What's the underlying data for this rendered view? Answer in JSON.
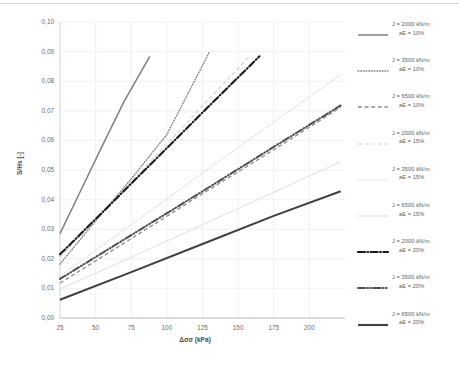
{
  "chart_data": {
    "type": "line",
    "title": "",
    "xlabel": "Δσσ (kPa)",
    "ylabel": "S/Hs [-]",
    "xlim": [
      25,
      225
    ],
    "ylim": [
      0.0,
      0.1
    ],
    "xticks": [
      25,
      50,
      75,
      100,
      125,
      150,
      175,
      200
    ],
    "xtick_labels": [
      "25",
      "50",
      "75",
      "100",
      "125",
      "150",
      "175",
      "200"
    ],
    "yticks": [
      0.0,
      0.01,
      0.02,
      0.03,
      0.04,
      0.05,
      0.06,
      0.07,
      0.08,
      0.09,
      0.1
    ],
    "ytick_labels": [
      "0,00",
      "0,01",
      "0,02",
      "0,03",
      "0,04",
      "0,05",
      "0,06",
      "0,07",
      "0,08",
      "0,09",
      "0,10"
    ],
    "grid": true,
    "legend_position": "right",
    "decimal_separator": ",",
    "series": [
      {
        "name": "J = 2000 kN/m aE = 10%",
        "label_line1": "J = 2000 kN/m",
        "label_line2": "aE = 10%",
        "J": 2000,
        "aE": "10%",
        "style": "solid",
        "color": "#808080",
        "width": 1.5,
        "x": [
          25,
          40,
          55,
          70,
          88
        ],
        "y": [
          0.0285,
          0.0435,
          0.0585,
          0.0732,
          0.0884
        ]
      },
      {
        "name": "J = 3500 kN/m aE = 10%",
        "label_line1": "J = 3500 kN/m",
        "label_line2": "aE = 10%",
        "J": 3500,
        "aE": "10%",
        "style": "dotted",
        "color": "#7f7f7f",
        "width": 1.4,
        "x": [
          25,
          50,
          75,
          100,
          130
        ],
        "y": [
          0.0182,
          0.0328,
          0.047,
          0.062,
          0.09
        ]
      },
      {
        "name": "J = 6500 kN/m aE = 10%",
        "label_line1": "J = 6500 kN/m",
        "label_line2": "aE = 10%",
        "J": 6500,
        "aE": "10%",
        "style": "dashed",
        "color": "#8c8c8c",
        "width": 1.3,
        "x": [
          25,
          75,
          125,
          175,
          222
        ],
        "y": [
          0.0118,
          0.0268,
          0.042,
          0.0568,
          0.0712
        ]
      },
      {
        "name": "J = 2000 kN/m aE = 15%",
        "label_line1": "J = 2000 kN/m",
        "label_line2": "aE = 15%",
        "J": 2000,
        "aE": "15%",
        "style": "dashed-light",
        "color": "#d2d2d2",
        "width": 1.2,
        "x": [
          25,
          60,
          95,
          130,
          158
        ],
        "y": [
          0.0205,
          0.0385,
          0.0562,
          0.0742,
          0.0884
        ]
      },
      {
        "name": "J = 3500 kN/m aE = 15%",
        "label_line1": "J = 3500 kN/m",
        "label_line2": "aE = 15%",
        "J": 3500,
        "aE": "15%",
        "style": "dotted-light",
        "color": "#dcdcdc",
        "width": 1.2,
        "x": [
          25,
          75,
          125,
          175,
          222
        ],
        "y": [
          0.0142,
          0.0315,
          0.049,
          0.0662,
          0.0822
        ]
      },
      {
        "name": "J = 6500 kN/m aE = 15%",
        "label_line1": "J = 6500 kN/m",
        "label_line2": "aE = 15%",
        "J": 6500,
        "aE": "15%",
        "style": "solid-light",
        "color": "#e2e2e2",
        "width": 1.2,
        "x": [
          25,
          75,
          125,
          175,
          222
        ],
        "y": [
          0.0098,
          0.0205,
          0.0315,
          0.0425,
          0.0528
        ]
      },
      {
        "name": "J = 2000 kN/m aE = 20%",
        "label_line1": "J = 2000 kN/m",
        "label_line2": "aE = 20%",
        "J": 2000,
        "aE": "20%",
        "style": "dashdot-thick",
        "color": "#1a1a1a",
        "width": 2.1,
        "x": [
          25,
          60,
          95,
          130,
          165
        ],
        "y": [
          0.0215,
          0.0382,
          0.055,
          0.0718,
          0.0884
        ]
      },
      {
        "name": "J = 3500 kN/m aE = 20%",
        "label_line1": "J = 3500 kN/m",
        "label_line2": "aE = 20%",
        "J": 3500,
        "aE": "20%",
        "style": "dashdotdot-thick",
        "color": "#4d4d4d",
        "width": 2.0,
        "x": [
          25,
          75,
          125,
          175,
          222
        ],
        "y": [
          0.0132,
          0.028,
          0.0428,
          0.0578,
          0.0718
        ]
      },
      {
        "name": "J = 6500 kN/m aE = 20%",
        "label_line1": "J = 6500 kN/m",
        "label_line2": "aE = 20%",
        "J": 6500,
        "aE": "20%",
        "style": "solid-thick",
        "color": "#404040",
        "width": 2.1,
        "x": [
          25,
          75,
          125,
          175,
          222
        ],
        "y": [
          0.0062,
          0.0155,
          0.025,
          0.0345,
          0.0428
        ]
      }
    ]
  }
}
